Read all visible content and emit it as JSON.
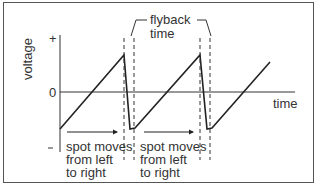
{
  "diagram": {
    "title": "",
    "axis": {
      "y_label": "voltage",
      "x_label": "time",
      "y_ticks": [
        "+",
        "0",
        "–"
      ]
    },
    "annotations": {
      "flyback_line1": "flyback",
      "flyback_line2": "time",
      "sweep1": [
        "spot moves",
        "from left",
        "to right"
      ],
      "sweep2": [
        "spot moves",
        "from left",
        "to right"
      ]
    },
    "colors": {
      "line": "#222222",
      "text": "#333333",
      "background": "#ffffff"
    }
  }
}
